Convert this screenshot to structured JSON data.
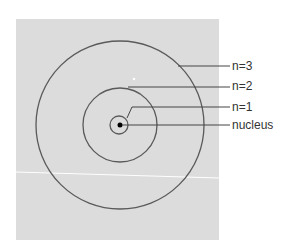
{
  "diagram": {
    "labels": {
      "n3": "n=3",
      "n2": "n=2",
      "n1": "n=1",
      "nucleus": "nucleus"
    },
    "colors": {
      "background_panel": "#dcdcdc",
      "stroke": "#555555",
      "nucleus": "#000000",
      "text": "#333333"
    }
  }
}
